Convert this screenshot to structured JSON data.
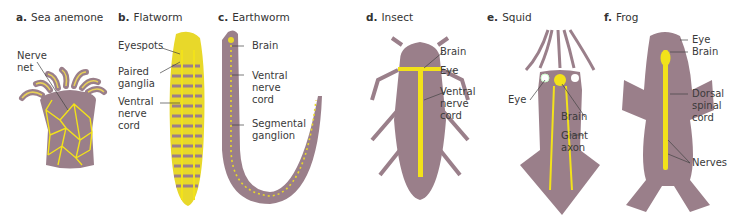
{
  "figure": {
    "colors": {
      "body": "#9a7f8a",
      "nerve": "#f2e21a",
      "nerve_dim": "#d8c85a",
      "text": "#3a3a3a",
      "leader": "#444444",
      "background": "#ffffff"
    },
    "panels": [
      {
        "letter": "a.",
        "name": "Sea anemone",
        "labels": [
          "Nerve\nnet"
        ]
      },
      {
        "letter": "b.",
        "name": "Flatworm",
        "labels": [
          "Eyespots",
          "Paired\nganglia",
          "Ventral\nnerve\ncord"
        ]
      },
      {
        "letter": "c.",
        "name": "Earthworm",
        "labels": [
          "Brain",
          "Ventral\nnerve\ncord",
          "Segmental\nganglion"
        ]
      },
      {
        "letter": "d.",
        "name": "Insect",
        "labels": [
          "Brain",
          "Eye",
          "Ventral\nnerve\ncord"
        ]
      },
      {
        "letter": "e.",
        "name": "Squid",
        "labels": [
          "Eye",
          "Brain",
          "Giant\naxon"
        ]
      },
      {
        "letter": "f.",
        "name": "Frog",
        "labels": [
          "Eye",
          "Brain",
          "Dorsal\nspinal\ncord",
          "Nerves"
        ]
      }
    ]
  }
}
